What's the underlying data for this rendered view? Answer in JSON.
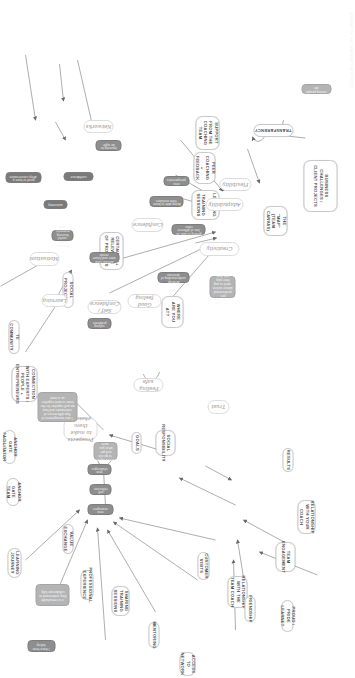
{
  "diagram": {
    "orientation": "rotated-90",
    "accent": "#8e8e8e",
    "node_border": "#c9c9c9",
    "text_color": "#4a4a4a",
    "faint_header": "MINDMAP OF THE LEARNING EXPERIENCE",
    "clusters": [
      {
        "id": "flexibility",
        "label": "Flexibility"
      },
      {
        "id": "adaptability",
        "label": "Adaptability"
      },
      {
        "id": "creativity",
        "label": "Creativity"
      },
      {
        "id": "learning",
        "label": "Learning"
      },
      {
        "id": "networks",
        "label": "Networks"
      },
      {
        "id": "motivation",
        "label": "Motivation"
      },
      {
        "id": "trust",
        "label": "Trust"
      },
      {
        "id": "confidence",
        "label": "Confidence"
      },
      {
        "id": "goodfeeling",
        "label": "Good feeling"
      },
      {
        "id": "feelingsafe",
        "label": "Feeling safe"
      },
      {
        "id": "selfconf",
        "label": "Self / Confidence"
      },
      {
        "id": "prospects",
        "label": "Prospects to make them choices"
      }
    ],
    "nodes": [
      {
        "id": "n01",
        "label": "Business Challenges / Client Projects"
      },
      {
        "id": "n02",
        "label": "Transparency"
      },
      {
        "id": "n03",
        "label": "Support from the coaching team"
      },
      {
        "id": "n04",
        "label": "Peer coaching + feedback"
      },
      {
        "id": "n05",
        "label": "Learning in training sessions"
      },
      {
        "id": "n06",
        "label": "The \"Map\" (Team Canvas)"
      },
      {
        "id": "n07",
        "label": "Certainty + relevance of projects"
      },
      {
        "id": "n08",
        "label": "Social projects"
      },
      {
        "id": "n09",
        "label": "Where are you at?"
      },
      {
        "id": "n10",
        "label": "TE Community"
      },
      {
        "id": "n11",
        "label": "Connection with experts / people + entrepreneurs"
      },
      {
        "id": "n12",
        "label": "Anchor gate facilitator"
      },
      {
        "id": "n13",
        "label": "Anchor gate team"
      },
      {
        "id": "n14",
        "label": "Learning journey"
      },
      {
        "id": "n15",
        "label": "Value exchange"
      },
      {
        "id": "n16",
        "label": "Professional experience"
      },
      {
        "id": "n17",
        "label": "Sharing training sessions"
      },
      {
        "id": "n18",
        "label": "Mentoring"
      },
      {
        "id": "n19",
        "label": "Access to network"
      },
      {
        "id": "n20",
        "label": "Customer visits"
      },
      {
        "id": "n21",
        "label": "Relationship with the team coach"
      },
      {
        "id": "n22",
        "label": "Relationship with your coach"
      },
      {
        "id": "n23",
        "label": "Team engagement"
      },
      {
        "id": "n24",
        "label": "Proud / Pride Learnet"
      },
      {
        "id": "n25",
        "label": "Friendship"
      },
      {
        "id": "n26",
        "label": "Social responsibility"
      },
      {
        "id": "n27",
        "label": "Goals"
      },
      {
        "id": "n28",
        "label": "Results"
      }
    ],
    "annotations": [
      {
        "id": "a01",
        "text": "seeing people win"
      },
      {
        "id": "a02",
        "text": "new perspectives"
      },
      {
        "id": "a03",
        "text": "being able to learn from mistakes"
      },
      {
        "id": "a04",
        "text": "getting to take on lots of different roles"
      },
      {
        "id": "a05",
        "text": "without clear aims and future needs"
      },
      {
        "id": "a06",
        "text": "develop understanding of direction"
      },
      {
        "id": "a07",
        "text": "learning to be agile"
      },
      {
        "id": "a08",
        "text": "solving problems"
      },
      {
        "id": "a09",
        "text": "I can show people the pre-professional advice and to work to pay their way with their own time"
      },
      {
        "id": "a10",
        "text": "encouraged to go out and get what you want"
      },
      {
        "id": "a11",
        "text": "new challenges"
      },
      {
        "id": "a12",
        "text": "self reflection"
      },
      {
        "id": "a13",
        "text": "new managers"
      },
      {
        "id": "a14",
        "text": "I see management of flow differences of individuals and how we pull together for the team to work together as a team"
      },
      {
        "id": "a15",
        "text": "it is remarkable they understand to collaborate fully"
      },
      {
        "id": "a16",
        "text": "confidence"
      },
      {
        "id": "a17",
        "text": "autonomy"
      },
      {
        "id": "a18",
        "text": "good to have a deep conversation"
      },
      {
        "id": "a19",
        "text": "there are some useful learning moments here"
      },
      {
        "id": "a20",
        "text": "I learn from failing"
      }
    ]
  }
}
